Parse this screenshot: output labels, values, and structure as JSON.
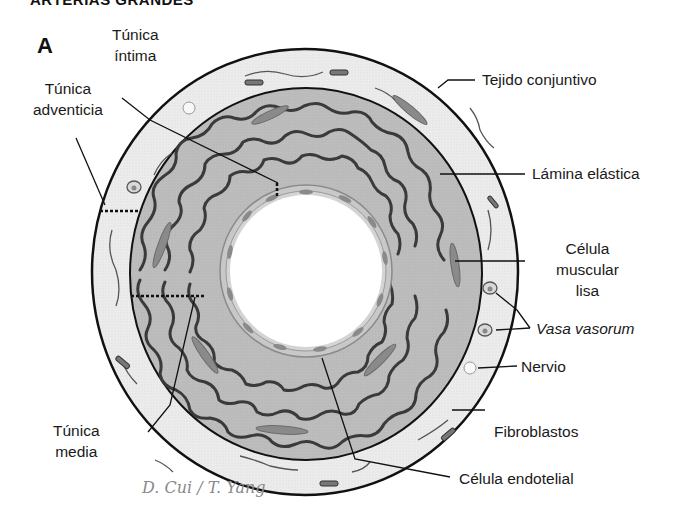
{
  "header": {
    "title": "ARTERIAS GRANDES"
  },
  "panel_label": "A",
  "labels": {
    "tunica_intima": {
      "line1": "Túnica",
      "line2": "íntima"
    },
    "tunica_adventicia": {
      "line1": "Túnica",
      "line2": "adventicia"
    },
    "tunica_media": {
      "line1": "Túnica",
      "line2": "media"
    },
    "tejido_conjuntivo": "Tejido conjuntivo",
    "lamina_elastica": "Lámina elástica",
    "celula_muscular_lisa": {
      "line1": "Célula",
      "line2": "muscular",
      "line3": "lisa"
    },
    "vasa_vasorum": "Vasa vasorum",
    "nervio": "Nervio",
    "fibroblastos": "Fibroblastos",
    "celula_endotelial": "Célula endotelial"
  },
  "signature": "D. Cui / T. Yang",
  "colors": {
    "adventitia_fill": "#ececec",
    "media_fill": "#bdbdbd",
    "elastic_fiber": "#3a3a3a",
    "endothelium": "#9a9a9a",
    "lumen": "#ffffff",
    "outline": "#111111"
  }
}
